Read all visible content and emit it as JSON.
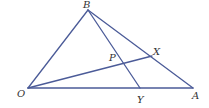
{
  "diagram": {
    "type": "triangle-with-cevians",
    "line_color": "#4b5b98",
    "label_color": "#333333",
    "points": {
      "O": {
        "label": "O",
        "x": 28,
        "y": 88
      },
      "B": {
        "label": "B",
        "x": 88,
        "y": 10
      },
      "A": {
        "label": "A",
        "x": 193,
        "y": 88
      },
      "X": {
        "label": "X",
        "x": 152,
        "y": 56
      },
      "Y": {
        "label": "Y",
        "x": 140,
        "y": 88
      },
      "P": {
        "label": "P",
        "x": 124,
        "y": 63
      }
    },
    "segments": [
      [
        "O",
        "B"
      ],
      [
        "B",
        "A"
      ],
      [
        "O",
        "A"
      ],
      [
        "O",
        "X"
      ],
      [
        "B",
        "Y"
      ]
    ]
  }
}
